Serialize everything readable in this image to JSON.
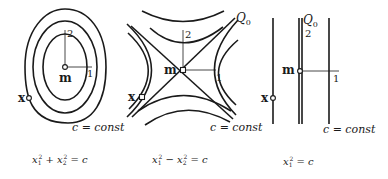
{
  "panels": [
    {
      "id": "ellipse",
      "mean_label": "m",
      "point_label": "x",
      "axis_labels": [
        "1",
        "2"
      ],
      "curve_label": "c = const",
      "equation": {
        "lhs_terms": [
          "x",
          "1",
          "2",
          "+",
          "x",
          "2",
          "2"
        ],
        "text": "x₁² + x₂² = c",
        "rhs": "= c"
      }
    },
    {
      "id": "hyperbola",
      "mean_label": "m",
      "point_label": "x",
      "axis_labels": [
        "1",
        "2"
      ],
      "asymptote_label": "Q",
      "asymptote_sub": "0",
      "curve_label": "c = const",
      "equation": {
        "text": "x₁² − x₂² = c",
        "rhs": "= c"
      }
    },
    {
      "id": "lines",
      "mean_label": "m",
      "point_label": "x",
      "axis_labels": [
        "1",
        "2"
      ],
      "asymptote_label": "Q",
      "asymptote_sub": "0",
      "curve_label": "c = const",
      "equation": {
        "text": "x₁² = c",
        "rhs": "= c"
      }
    }
  ],
  "eq_parts": {
    "x": "x",
    "one": "1",
    "two": "2",
    "plus": " + ",
    "minus": " − ",
    "eq_c": " = c",
    "sup2": "2"
  }
}
